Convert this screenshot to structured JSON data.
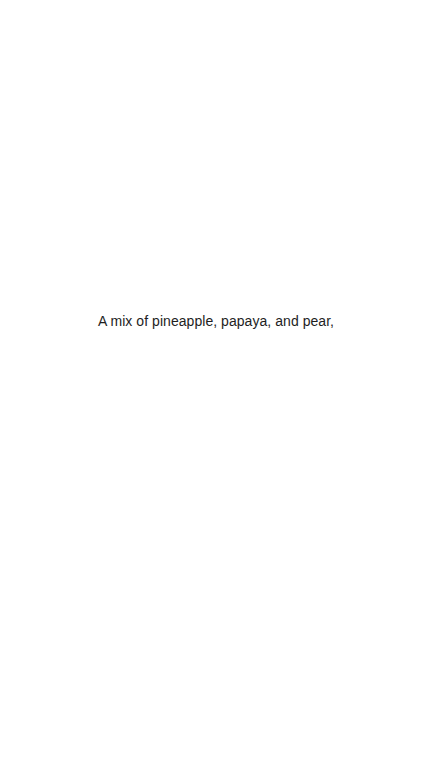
{
  "page": {
    "background_color": "#ffffff",
    "width": 432,
    "height": 769
  },
  "content": {
    "caption": "A mix of pineapple, papaya, and pear,",
    "text_color": "#1e1e1e",
    "alignment": "center"
  }
}
